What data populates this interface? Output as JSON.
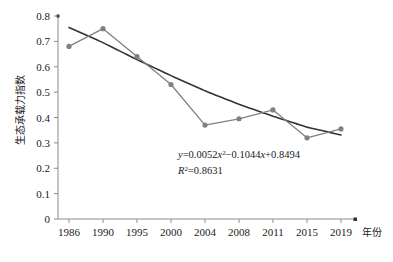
{
  "chart_data": {
    "type": "line",
    "title": "",
    "xlabel": "年份",
    "ylabel": "生态承载力指数",
    "categories": [
      "1986",
      "1990",
      "1995",
      "2000",
      "2004",
      "2008",
      "2011",
      "2015",
      "2019"
    ],
    "series": [
      {
        "name": "生态承载力指数",
        "type": "line-with-markers",
        "color": "#808080",
        "marker": "circle",
        "values": [
          0.68,
          0.75,
          0.64,
          0.53,
          0.37,
          0.395,
          0.43,
          0.32,
          0.355
        ]
      },
      {
        "name": "多项式趋势线",
        "type": "trendline-polynomial",
        "color": "#333333",
        "order": 2,
        "values": [
          0.755,
          0.695,
          0.628,
          0.565,
          0.505,
          0.452,
          0.405,
          0.362,
          0.331
        ]
      }
    ],
    "ylim": [
      0,
      0.8
    ],
    "ytick_labels": [
      "0",
      "0.1",
      "0.2",
      "0.3",
      "0.4",
      "0.5",
      "0.6",
      "0.7",
      "0.8"
    ],
    "ytick_values": [
      0,
      0.1,
      0.2,
      0.3,
      0.4,
      0.5,
      0.6,
      0.7,
      0.8
    ],
    "grid": false,
    "legend": "none",
    "annotations": {
      "equation": {
        "y_var": "y",
        "eq_sign": "=",
        "term1_coef": "0.0052",
        "term1_var": "x",
        "term1_exp": "2",
        "term2": "−0.1044",
        "term2_var": "x",
        "term3": "+0.8494",
        "full": "y=0.0052x2−0.1044x+0.8494"
      },
      "r_squared": {
        "symbol": "R",
        "exp": "2",
        "eq_sign": "=",
        "value": "0.8631",
        "full": "R2=0.8631"
      }
    }
  },
  "colors": {
    "series": "#808080",
    "trendline": "#333333",
    "axis": "#8a8a8a",
    "text": "#1a1a1a",
    "background": "#ffffff"
  }
}
